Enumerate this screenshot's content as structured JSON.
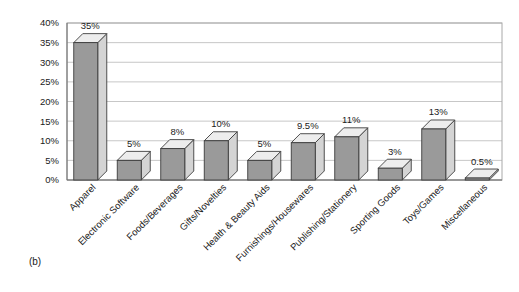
{
  "figure": {
    "caption": "(b)"
  },
  "chart_data": {
    "type": "bar",
    "title": "",
    "xlabel": "",
    "ylabel": "",
    "grid": true,
    "legend": "none",
    "style": "3d-column",
    "ylim": [
      0,
      40
    ],
    "ytick_labels": [
      "40%",
      "35%",
      "30%",
      "25%",
      "20%",
      "15%",
      "10%",
      "5%",
      "0%"
    ],
    "ytick_values": [
      40,
      35,
      30,
      25,
      20,
      15,
      10,
      5,
      0
    ],
    "categories": [
      "Apparel",
      "Electronic Software",
      "Foods/Beverages",
      "Gifts/Novelties",
      "Health & Beauty Aids",
      "Furnishings/Housewares",
      "Publishing/Stationery",
      "Sporting Goods",
      "Toys/Games",
      "Miscellaneous"
    ],
    "values": [
      35,
      5,
      8,
      10,
      5,
      9.5,
      11,
      3,
      13,
      0.5
    ],
    "data_labels": [
      "35%",
      "5%",
      "8%",
      "10%",
      "5%",
      "9.5%",
      "11%",
      "3%",
      "13%",
      "0.5%"
    ],
    "colors": {
      "bar_front": "#9a9a9a",
      "bar_side": "#d4d4d4",
      "bar_top": "#ededed",
      "bar_edge": "#3d3d3d",
      "grid": "#b9b9b9",
      "frame": "#a8a8a8",
      "text": "#1a1a1a",
      "background": "#ffffff"
    }
  }
}
